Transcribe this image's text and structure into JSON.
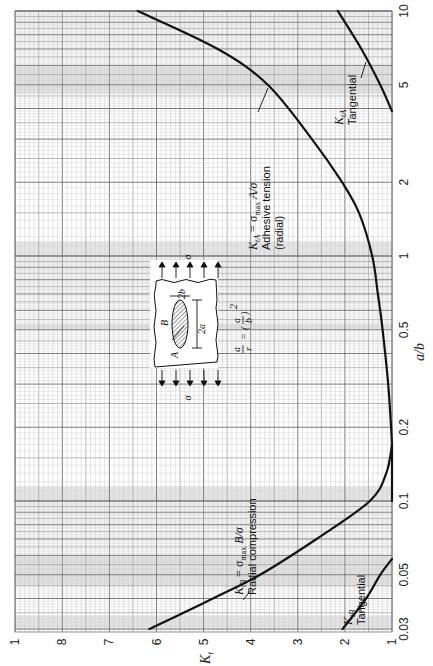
{
  "chart_data": {
    "type": "line",
    "orientation": "rotated-90-clockwise",
    "title": "",
    "xlabel": "a/b",
    "ylabel": "K_t",
    "xscale": "log",
    "xlim": [
      0.03,
      10
    ],
    "ylim": [
      1,
      9
    ],
    "grid": true,
    "x_ticks": [
      "0.03",
      "0.05",
      "0.1",
      "0.2",
      "0.5",
      "1",
      "2",
      "5",
      "10"
    ],
    "y_ticks": [
      "1",
      "2",
      "3",
      "4",
      "5",
      "6",
      "7",
      "8",
      "1"
    ],
    "series": [
      {
        "name": "K_tA = σ_max A/σ Adhesive tension (radial)",
        "x": [
          0.17,
          0.2,
          0.3,
          0.5,
          0.7,
          1,
          1.5,
          2,
          3,
          5,
          7,
          10
        ],
        "y": [
          1.0,
          1.02,
          1.08,
          1.2,
          1.3,
          1.42,
          1.7,
          2.06,
          2.7,
          3.64,
          4.7,
          6.4
        ]
      },
      {
        "name": "K_tA Tangential",
        "x": [
          3.9,
          5,
          7,
          10
        ],
        "y": [
          1.0,
          1.25,
          1.65,
          2.15
        ]
      },
      {
        "name": "K_tB = σ_max B/σ Radial compression",
        "x": [
          0.03,
          0.04,
          0.05,
          0.07,
          0.1,
          0.13,
          0.17
        ],
        "y": [
          6.15,
          4.8,
          3.8,
          2.6,
          1.47,
          1.12,
          1.0
        ]
      },
      {
        "name": "K_tB Tangential",
        "x": [
          0.03,
          0.04,
          0.05,
          0.058
        ],
        "y": [
          2.05,
          1.55,
          1.25,
          1.0
        ]
      },
      {
        "name": "K_t = 1 segment",
        "x": [
          0.1,
          0.17
        ],
        "y": [
          1.0,
          1.0
        ]
      }
    ],
    "annotations": [
      {
        "text_main": "K",
        "text_sub": "tA",
        "text_rest": " = σmax A/σ",
        "line2": "Adhesive tension",
        "line3": "(radial)"
      },
      {
        "text_main": "K",
        "text_sub": "tA",
        "line2": "Tangential"
      },
      {
        "text_main": "K",
        "text_sub": "tB",
        "text_rest": " = σmax B/σ",
        "line2": "Radial compression"
      },
      {
        "text_main": "K",
        "text_sub": "tB",
        "line2": "Tangential"
      }
    ],
    "inset": {
      "stress_label": "σ",
      "point_a": "A",
      "point_b": "B",
      "dim_2b": "2b",
      "dim_2a": "2a",
      "formula": "a/r = (a/b)²"
    }
  }
}
